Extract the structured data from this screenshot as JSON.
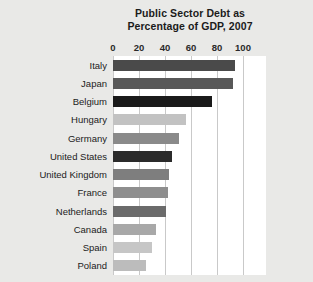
{
  "chart_data": {
    "type": "bar",
    "orientation": "horizontal",
    "title": "Public Sector Debt as Percentage of GDP, 2007",
    "title_lines": [
      "Public Sector Debt as",
      "Percentage of GDP, 2007"
    ],
    "xlabel": "",
    "ylabel": "",
    "categories": [
      "Italy",
      "Japan",
      "Belgium",
      "Hungary",
      "Germany",
      "United States",
      "United Kingdom",
      "France",
      "Netherlands",
      "Canada",
      "Spain",
      "Poland"
    ],
    "values": [
      94,
      92,
      76,
      56,
      51,
      45,
      43,
      42,
      41,
      33,
      30,
      25
    ],
    "bar_colors": [
      "#4a4a4a",
      "#585858",
      "#1a1a1a",
      "#c2c2c2",
      "#8a8a8a",
      "#2b2b2b",
      "#7e7e7e",
      "#8e8e8e",
      "#6b6b6b",
      "#a8a8a8",
      "#c6c6c6",
      "#bcbcbc"
    ],
    "xlim": [
      0,
      100
    ],
    "xticks": [
      0,
      20,
      40,
      60,
      80,
      100
    ],
    "xtick_labels": [
      "0",
      "20",
      "40",
      "60",
      "80",
      "100"
    ],
    "grid": true,
    "grid_axis": "x",
    "legend": false,
    "plot_background": "#ffffff",
    "page_background": "#e9e9e7",
    "gridline_color": "#c9c9c9"
  }
}
